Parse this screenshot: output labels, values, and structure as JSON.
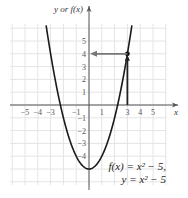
{
  "chart_data": {
    "type": "line",
    "title": "",
    "xlabel": "x",
    "ylabel": "y or f(x)",
    "xlim": [
      -6,
      6
    ],
    "ylim": [
      -6,
      6
    ],
    "grid": true,
    "x_ticks": [
      "−5",
      "−4",
      "−3",
      "−1",
      "1",
      "3",
      "4",
      "5"
    ],
    "y_ticks": [
      "5",
      "4",
      "3",
      "2",
      "1",
      "−1",
      "−2",
      "−3",
      "−4"
    ],
    "series": [
      {
        "name": "f(x) = x² − 5",
        "function": "x^2 - 5",
        "x": [
          -3.3,
          -3,
          -2,
          -1,
          0,
          1,
          2,
          3,
          3.3
        ],
        "y": [
          5.89,
          4,
          -1,
          -4,
          -5,
          -4,
          -1,
          4,
          5.89
        ]
      }
    ],
    "annotations": [
      {
        "type": "point",
        "x": 3,
        "y": 4
      },
      {
        "type": "arrow",
        "from": [
          3,
          0
        ],
        "to": [
          3,
          4
        ],
        "desc": "vertical arrow from x=3 up to curve"
      },
      {
        "type": "arrow",
        "from": [
          3,
          4
        ],
        "to": [
          0,
          4
        ],
        "desc": "horizontal arrow from curve to y-axis at 4"
      }
    ],
    "legend": [
      "f(x) = x² − 5,",
      "y = x² − 5"
    ]
  },
  "labels": {
    "y_axis": "y or f(x)",
    "x_axis": "x",
    "equation_line1": "f(x) = x² − 5,",
    "equation_line2": "y = x² − 5"
  },
  "ticks": {
    "x": [
      {
        "v": -5,
        "t": "−5"
      },
      {
        "v": -4,
        "t": "−4"
      },
      {
        "v": -3,
        "t": "−3"
      },
      {
        "v": -1,
        "t": "−1"
      },
      {
        "v": 1,
        "t": "1"
      },
      {
        "v": 3,
        "t": "3"
      },
      {
        "v": 4,
        "t": "4"
      },
      {
        "v": 5,
        "t": "5"
      }
    ],
    "y": [
      {
        "v": 5,
        "t": "5"
      },
      {
        "v": 4,
        "t": "4"
      },
      {
        "v": 3,
        "t": "3"
      },
      {
        "v": 2,
        "t": "2"
      },
      {
        "v": 1,
        "t": "1"
      },
      {
        "v": -1,
        "t": "−1"
      },
      {
        "v": -2,
        "t": "−2"
      },
      {
        "v": -3,
        "t": "−3"
      },
      {
        "v": -4,
        "t": "−4"
      }
    ]
  },
  "colors": {
    "grid": "#e4e4e4",
    "axis": "#555555",
    "curve": "#1a1a1a",
    "arrow": "#777777"
  }
}
